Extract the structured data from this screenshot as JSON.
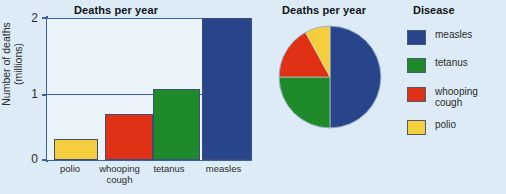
{
  "figure": {
    "background_color": "#dcebf5",
    "plot_background_color": "#eaf4fa",
    "axis_color": "#3c5fa8"
  },
  "bar_chart": {
    "title": "Deaths per year",
    "y_axis_label": "Number of deaths\n(millions)",
    "y_axis_label_line1": "Number of deaths",
    "y_axis_label_line2": "(millions)",
    "tick_labels": [
      "2",
      "1",
      "0"
    ]
  },
  "pie_chart": {
    "title": "Deaths per year"
  },
  "legend": {
    "title": "Disease",
    "items": [
      {
        "label": "measles",
        "color": "#28458c"
      },
      {
        "label": "tetanus",
        "color": "#1f8a2a"
      },
      {
        "label": "whooping\ncough",
        "color": "#e03116"
      },
      {
        "label": "polio",
        "color": "#f5ce3e"
      }
    ]
  },
  "chart_data": [
    {
      "type": "bar",
      "title": "Deaths per year",
      "xlabel": "",
      "ylabel": "Number of deaths (millions)",
      "ylim": [
        0,
        2
      ],
      "yticks": [
        0,
        1,
        2
      ],
      "grid": true,
      "categories": [
        "polio",
        "whooping cough",
        "tetanus",
        "measles"
      ],
      "values": [
        0.3,
        0.65,
        1.0,
        2.0
      ],
      "colors": [
        "#f5ce3e",
        "#e03116",
        "#1f8a2a",
        "#28458c"
      ]
    },
    {
      "type": "pie",
      "title": "Deaths per year",
      "labels": [
        "measles",
        "tetanus",
        "whooping cough",
        "polio"
      ],
      "values": [
        50,
        25,
        17,
        8
      ],
      "colors": [
        "#28458c",
        "#1f8a2a",
        "#e03116",
        "#f5ce3e"
      ],
      "legend_position": "right",
      "start_angle_deg": 0,
      "direction": "clockwise"
    }
  ]
}
